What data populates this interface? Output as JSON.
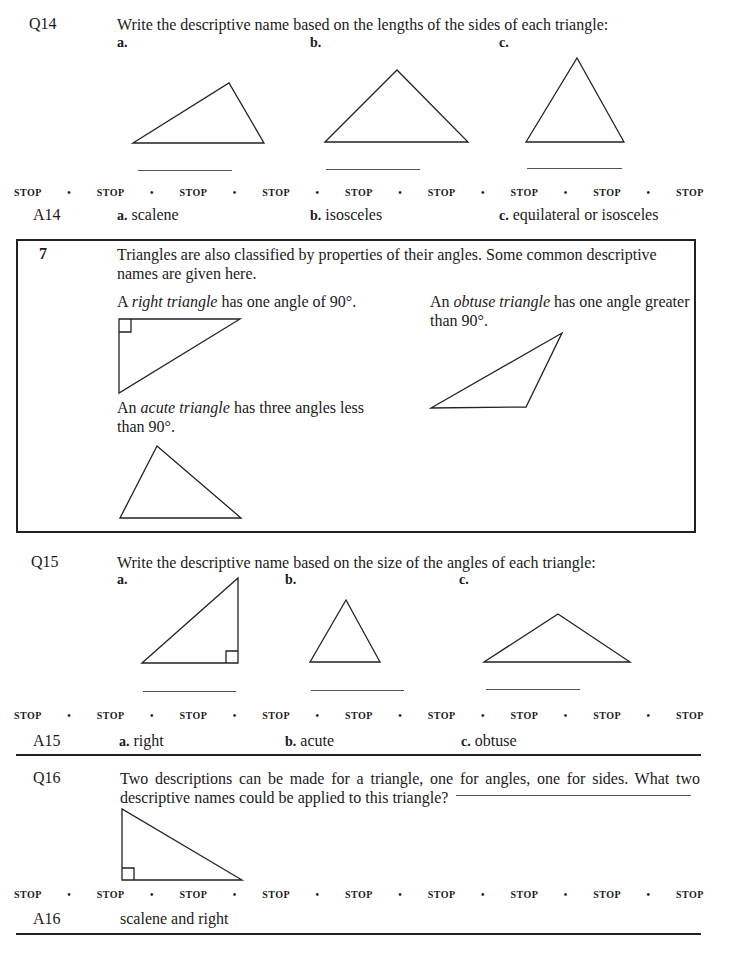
{
  "q14": {
    "label": "Q14",
    "prompt": "Write the descriptive name based on the lengths of the sides of each triangle:",
    "parts": [
      "a.",
      "b.",
      "c."
    ]
  },
  "stop": {
    "word": "STOP",
    "separator": "•"
  },
  "a14": {
    "label": "A14",
    "answers": [
      {
        "letter": "a.",
        "text": "scalene"
      },
      {
        "letter": "b.",
        "text": "isosceles"
      },
      {
        "letter": "c.",
        "text": "equilateral or isosceles"
      }
    ]
  },
  "frame7": {
    "number": "7",
    "intro": "Triangles are also classified by properties of their angles. Some common descriptive names are given here.",
    "right": {
      "pre": "A ",
      "term": "right triangle",
      "post": " has one angle of 90°."
    },
    "obtuse": {
      "pre": "An ",
      "term": "obtuse triangle",
      "post": " has one angle greater than 90°."
    },
    "acute": {
      "pre": "An ",
      "term": "acute triangle",
      "post": " has three angles less than 90°."
    }
  },
  "q15": {
    "label": "Q15",
    "prompt": "Write the descriptive name based on the size of the angles of each triangle:",
    "parts": [
      "a.",
      "b.",
      "c."
    ]
  },
  "a15": {
    "label": "A15",
    "answers": [
      {
        "letter": "a.",
        "text": "right"
      },
      {
        "letter": "b.",
        "text": "acute"
      },
      {
        "letter": "c.",
        "text": "obtuse"
      }
    ]
  },
  "q16": {
    "label": "Q16",
    "prompt": "Two descriptions can be made for a triangle, one for angles, one for sides. What two descriptive names could be applied to this triangle?"
  },
  "a16": {
    "label": "A16",
    "text": "scalene and right"
  }
}
